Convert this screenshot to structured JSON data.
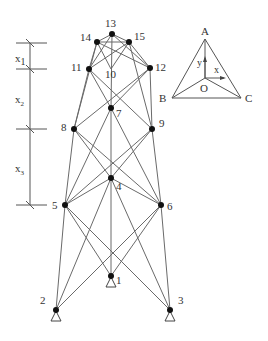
{
  "diagram": {
    "type": "space-truss-tower",
    "nodes": [
      {
        "id": "1",
        "label": "1",
        "x": 111,
        "y": 276,
        "support": true
      },
      {
        "id": "2",
        "label": "2",
        "x": 56,
        "y": 310,
        "support": true
      },
      {
        "id": "3",
        "label": "3",
        "x": 170,
        "y": 310,
        "support": true
      },
      {
        "id": "4",
        "label": "4",
        "x": 111,
        "y": 178
      },
      {
        "id": "5",
        "label": "5",
        "x": 65,
        "y": 205
      },
      {
        "id": "6",
        "label": "6",
        "x": 161,
        "y": 205
      },
      {
        "id": "7",
        "label": "7",
        "x": 111,
        "y": 108
      },
      {
        "id": "8",
        "label": "8",
        "x": 74,
        "y": 129
      },
      {
        "id": "9",
        "label": "9",
        "x": 152,
        "y": 129
      },
      {
        "id": "10",
        "label": "10",
        "x": 111,
        "y": 69
      },
      {
        "id": "11",
        "label": "11",
        "x": 89,
        "y": 69
      },
      {
        "id": "12",
        "label": "12",
        "x": 150,
        "y": 68
      },
      {
        "id": "13",
        "label": "13",
        "x": 112,
        "y": 34
      },
      {
        "id": "14",
        "label": "14",
        "x": 97,
        "y": 42
      },
      {
        "id": "15",
        "label": "15",
        "x": 129,
        "y": 42
      }
    ],
    "dimensions": [
      {
        "label": "x",
        "sub": "1"
      },
      {
        "label": "x",
        "sub": "2"
      },
      {
        "label": "x",
        "sub": "3"
      }
    ],
    "inset": {
      "vertices": {
        "A": "A",
        "B": "B",
        "C": "C",
        "O": "O"
      },
      "axes": {
        "x": "x",
        "y": "y"
      }
    }
  }
}
